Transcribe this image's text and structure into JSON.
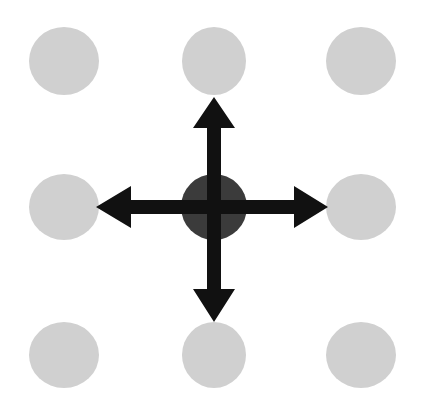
{
  "figure": {
    "canvas": {
      "width": 430,
      "height": 409,
      "background": "#ffffff"
    }
  },
  "colors": {
    "background": "#ffffff",
    "node_fill": "#d0d0d0",
    "center_node_fill": "#3b3b3b",
    "arrow_fill": "#111111"
  },
  "grid": {
    "rows": 3,
    "columns": 3,
    "column_centers_x": [
      64,
      214,
      361
    ],
    "row_centers_y": [
      61,
      207,
      355
    ],
    "node_radius_x": 35,
    "node_radius_y": 34,
    "center_node_radius_x": 33,
    "center_node_radius_y": 33
  },
  "nodes": [
    {
      "id": "node-top-left",
      "label": "top-left neighbor",
      "row": 0,
      "col": 0,
      "cx": 64,
      "cy": 61,
      "rx": 35,
      "ry": 34,
      "fill": "#d0d0d0",
      "role": "neighbor"
    },
    {
      "id": "node-top-center",
      "label": "top neighbor",
      "row": 0,
      "col": 1,
      "cx": 214,
      "cy": 61,
      "rx": 32,
      "ry": 34,
      "fill": "#d0d0d0",
      "role": "neighbor"
    },
    {
      "id": "node-top-right",
      "label": "top-right neighbor",
      "row": 0,
      "col": 2,
      "cx": 361,
      "cy": 61,
      "rx": 35,
      "ry": 34,
      "fill": "#d0d0d0",
      "role": "neighbor"
    },
    {
      "id": "node-middle-left",
      "label": "left neighbor",
      "row": 1,
      "col": 0,
      "cx": 64,
      "cy": 207,
      "rx": 35,
      "ry": 33,
      "fill": "#d0d0d0",
      "role": "neighbor"
    },
    {
      "id": "node-center",
      "label": "center node",
      "row": 1,
      "col": 1,
      "cx": 214,
      "cy": 207,
      "rx": 33,
      "ry": 33,
      "fill": "#3b3b3b",
      "role": "center"
    },
    {
      "id": "node-middle-right",
      "label": "right neighbor",
      "row": 1,
      "col": 2,
      "cx": 361,
      "cy": 207,
      "rx": 35,
      "ry": 33,
      "fill": "#d0d0d0",
      "role": "neighbor"
    },
    {
      "id": "node-bottom-left",
      "label": "bottom-left neighbor",
      "row": 2,
      "col": 0,
      "cx": 64,
      "cy": 355,
      "rx": 35,
      "ry": 33,
      "fill": "#d0d0d0",
      "role": "neighbor"
    },
    {
      "id": "node-bottom-center",
      "label": "bottom neighbor",
      "row": 2,
      "col": 1,
      "cx": 214,
      "cy": 355,
      "rx": 32,
      "ry": 33,
      "fill": "#d0d0d0",
      "role": "neighbor"
    },
    {
      "id": "node-bottom-right",
      "label": "bottom-right neighbor",
      "row": 2,
      "col": 2,
      "cx": 361,
      "cy": 355,
      "rx": 35,
      "ry": 33,
      "fill": "#d0d0d0",
      "role": "neighbor"
    }
  ],
  "arrows": [
    {
      "id": "arrow-up",
      "label": "up arrow",
      "direction": "up",
      "from": "node-center",
      "to": "node-top-center",
      "fill": "#111111",
      "points": "207,240 207,128 193,128 214,97 235,128 221,128 221,240"
    },
    {
      "id": "arrow-right",
      "label": "right arrow",
      "direction": "right",
      "from": "node-center",
      "to": "node-middle-right",
      "fill": "#111111",
      "points": "181,200 294,200 294,186 328,207 294,228 294,214 181,214"
    },
    {
      "id": "arrow-down",
      "label": "down arrow",
      "direction": "down",
      "from": "node-center",
      "to": "node-bottom-center",
      "fill": "#111111",
      "points": "207,174 207,289 193,289 214,322 235,289 221,289 221,174"
    },
    {
      "id": "arrow-left",
      "label": "left arrow",
      "direction": "left",
      "from": "node-center",
      "to": "node-middle-left",
      "fill": "#111111",
      "points": "247,200 131,200 131,186 96,207 131,228 131,214 247,214"
    }
  ]
}
